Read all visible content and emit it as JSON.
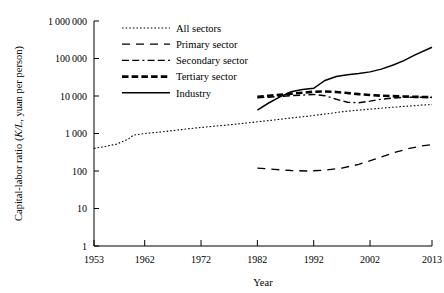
{
  "chart_data": {
    "type": "line",
    "title": "",
    "xlabel": "Year",
    "ylabel": "Capital-labor ratio (K/L, yuan per person)",
    "ylabel_parts": {
      "before": "Capital-labor ratio (",
      "italic": "K/L",
      "after": ", yuan per person)"
    },
    "xlim": [
      1953,
      2013
    ],
    "ylim": [
      1,
      1000000
    ],
    "yscale": "log",
    "grid": false,
    "legend_position": "top-center",
    "xticks": [
      1953,
      1962,
      1972,
      1982,
      1992,
      2002,
      2013
    ],
    "xtick_labels": [
      "1953",
      "1962",
      "1972",
      "1982",
      "1992",
      "2002",
      "2013"
    ],
    "yticks": [
      1,
      10,
      100,
      1000,
      10000,
      100000,
      1000000
    ],
    "ytick_labels": [
      "1",
      "10",
      "100",
      "1 000",
      "10 000",
      "100 000",
      "1 000 000"
    ],
    "series": [
      {
        "name": "All sectors",
        "style": "dotted",
        "linewidth": 1.1,
        "color": "#000000",
        "x": [
          1953,
          1955,
          1957,
          1959,
          1960,
          1962,
          1965,
          1968,
          1971,
          1974,
          1977,
          1980,
          1982,
          1985,
          1988,
          1991,
          1994,
          1997,
          2000,
          2003,
          2006,
          2009,
          2011,
          2013
        ],
        "y": [
          400,
          450,
          520,
          700,
          900,
          1000,
          1100,
          1250,
          1400,
          1550,
          1700,
          1900,
          2050,
          2300,
          2600,
          2900,
          3300,
          3800,
          4200,
          4600,
          5000,
          5400,
          5700,
          5900
        ]
      },
      {
        "name": "Primary sector",
        "style": "long-dash",
        "linewidth": 1.3,
        "color": "#000000",
        "x": [
          1982,
          1985,
          1988,
          1991,
          1994,
          1997,
          2000,
          2003,
          2006,
          2009,
          2011,
          2013
        ],
        "y": [
          120,
          110,
          103,
          100,
          105,
          120,
          150,
          210,
          300,
          400,
          460,
          510
        ]
      },
      {
        "name": "Secondary sector",
        "style": "dash-dash-dot",
        "linewidth": 1.4,
        "color": "#000000",
        "x": [
          1982,
          1984,
          1986,
          1988,
          1990,
          1992,
          1994,
          1996,
          1998,
          2000,
          2002,
          2004,
          2006,
          2008,
          2010,
          2013
        ],
        "y": [
          9000,
          9300,
          9700,
          10200,
          10600,
          11000,
          10200,
          8200,
          6800,
          6600,
          7300,
          8200,
          8800,
          9200,
          9300,
          9200
        ]
      },
      {
        "name": "Tertiary sector",
        "style": "bold-dash",
        "linewidth": 2.6,
        "color": "#000000",
        "x": [
          1982,
          1984,
          1986,
          1988,
          1990,
          1992,
          1994,
          1996,
          1998,
          2000,
          2002,
          2004,
          2006,
          2008,
          2010,
          2013
        ],
        "y": [
          9500,
          10200,
          10800,
          11500,
          12200,
          13000,
          13200,
          12800,
          12000,
          11200,
          10600,
          10200,
          9900,
          9700,
          9500,
          9300
        ]
      },
      {
        "name": "Industry",
        "style": "solid",
        "linewidth": 1.5,
        "color": "#000000",
        "x": [
          1982,
          1984,
          1986,
          1988,
          1990,
          1992,
          1994,
          1996,
          1998,
          2000,
          2002,
          2004,
          2006,
          2008,
          2010,
          2013
        ],
        "y": [
          4200,
          6500,
          9500,
          13000,
          15000,
          16000,
          26000,
          33000,
          37000,
          40000,
          44000,
          52000,
          66000,
          88000,
          125000,
          200000
        ]
      }
    ]
  }
}
